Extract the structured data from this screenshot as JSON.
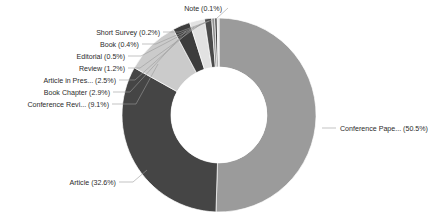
{
  "chart_data": {
    "type": "pie",
    "variant": "donut",
    "title": "",
    "subtitle": "",
    "xlabel": "",
    "ylabel": "",
    "legend_position": "none",
    "grid": false,
    "label_format": "{name} ({percent}%)",
    "start_angle_deg": 0,
    "direction": "clockwise",
    "categories": [
      "Conference Pape...",
      "Article",
      "Conference Revi...",
      "Book Chapter",
      "Article in Pres...",
      "Review",
      "Editorial",
      "Book",
      "Short Survey",
      "Note"
    ],
    "values": [
      50.5,
      32.6,
      9.1,
      2.9,
      2.5,
      1.2,
      0.5,
      0.4,
      0.2,
      0.1
    ],
    "units": "percent",
    "slices": [
      {
        "name": "Conference Pape...",
        "percent": 50.5,
        "label": "Conference Pape... (50.5%)",
        "color": "#9b9b9b",
        "label_side": "right"
      },
      {
        "name": "Article",
        "percent": 32.6,
        "label": "Article (32.6%)",
        "color": "#454545",
        "label_side": "left"
      },
      {
        "name": "Conference Revi...",
        "percent": 9.1,
        "label": "Conference Revi... (9.1%)",
        "color": "#cbcbcb",
        "label_side": "left"
      },
      {
        "name": "Book Chapter",
        "percent": 2.9,
        "label": "Book Chapter (2.9%)",
        "color": "#3d3d3d",
        "label_side": "left"
      },
      {
        "name": "Article in Pres...",
        "percent": 2.5,
        "label": "Article in Pres... (2.5%)",
        "color": "#e2e2e2",
        "label_side": "left"
      },
      {
        "name": "Review",
        "percent": 1.2,
        "label": "Review (1.2%)",
        "color": "#4a4a4a",
        "label_side": "left"
      },
      {
        "name": "Editorial",
        "percent": 0.5,
        "label": "Editorial (0.5%)",
        "color": "#8f8f8f",
        "label_side": "left"
      },
      {
        "name": "Book",
        "percent": 0.4,
        "label": "Book (0.4%)",
        "color": "#3a3a3a",
        "label_side": "left"
      },
      {
        "name": "Short Survey",
        "percent": 0.2,
        "label": "Short Survey (0.2%)",
        "color": "#d8d8d8",
        "label_side": "left"
      },
      {
        "name": "Note",
        "percent": 0.1,
        "label": "Note (0.1%)",
        "color": "#6e6e6e",
        "label_side": "top"
      }
    ]
  },
  "geometry": {
    "center_x": 219,
    "center_y": 115,
    "outer_radius": 97,
    "inner_radius": 48
  },
  "labels": {
    "note": "Note (0.1%)",
    "short_survey": "Short Survey (0.2%)",
    "book": "Book (0.4%)",
    "editorial": "Editorial (0.5%)",
    "review": "Review (1.2%)",
    "article_in_press": "Article in Pres... (2.5%)",
    "book_chapter": "Book Chapter (2.9%)",
    "conference_review": "Conference Revi... (9.1%)",
    "article": "Article (32.6%)",
    "conference_paper": "Conference Pape... (50.5%)"
  }
}
